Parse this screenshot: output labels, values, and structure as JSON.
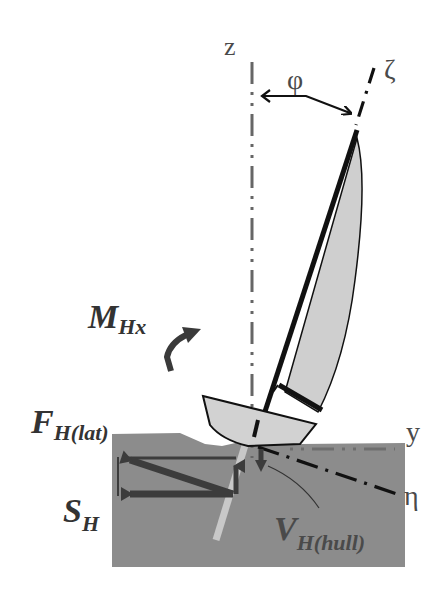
{
  "figure": {
    "colors": {
      "background": "#ffffff",
      "water": "#8c8c8c",
      "sail_fill": "#cfcfcf",
      "hull_fill": "#d2d2d2",
      "outline": "#111111",
      "force_arrows": "#3c3c3c",
      "keel": "#c8c8c8",
      "text": "#3a3a3a"
    }
  },
  "axes": {
    "z": {
      "label": "z"
    },
    "zeta": {
      "label": "ζ"
    },
    "y": {
      "label": "y"
    },
    "eta": {
      "label": "η"
    },
    "heel_angle": {
      "label": "φ"
    }
  },
  "forces": {
    "moment": {
      "symbol": "M",
      "subscript": "Hx"
    },
    "lateral_force": {
      "symbol": "F",
      "subscript": "H(lat)"
    },
    "side_force": {
      "symbol": "S",
      "subscript": "H"
    },
    "hull_vertical_force": {
      "symbol": "V",
      "subscript": "H(hull)"
    }
  }
}
